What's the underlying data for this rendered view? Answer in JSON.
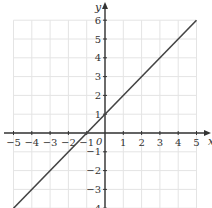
{
  "chart_data": {
    "type": "line",
    "title": "",
    "xlabel": "x",
    "ylabel": "y",
    "origin_label": "0",
    "xlim": [
      -5,
      5
    ],
    "ylim": [
      -4,
      6
    ],
    "grid": true,
    "x_ticks": [
      -5,
      -4,
      -3,
      -2,
      -1,
      1,
      2,
      3,
      4,
      5
    ],
    "x_tick_labels": [
      "−5",
      "−4",
      "−3",
      "−2",
      "−1",
      "1",
      "2",
      "3",
      "4",
      "5"
    ],
    "y_ticks": [
      -4,
      -3,
      -2,
      -1,
      1,
      2,
      3,
      4,
      5,
      6
    ],
    "y_tick_labels": [
      "−4",
      "−3",
      "−2",
      "−1",
      "1",
      "2",
      "3",
      "4",
      "5",
      "6"
    ],
    "series": [
      {
        "name": "y = x + 1",
        "x": [
          -5,
          5
        ],
        "y": [
          -4,
          6
        ],
        "color": "#444444"
      }
    ]
  },
  "colors": {
    "grid": "#e4e4e4",
    "axis": "#333333",
    "line": "#444444"
  }
}
